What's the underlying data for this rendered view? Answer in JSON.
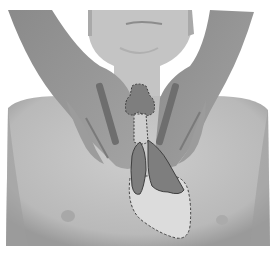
{
  "image": {
    "description": "Grayscale photo of a child's neck and upper chest with two adult hands placed on the neck; overlaid shaded shapes depict the thyroid gland, thymus lobes and a dashed outline of the heart area",
    "colors": {
      "background": "#ffffff",
      "skin_light": "#c9c9c9",
      "skin_mid": "#b3b3b3",
      "hands": "#8f8f8f",
      "overlay_fill": "#7e7e7e",
      "overlay_stroke": "#3f3f3f",
      "heart_fill": "#dcdcdc"
    },
    "overlays": [
      {
        "name": "thyroid",
        "style": "dashed outline, dark fill"
      },
      {
        "name": "trachea",
        "style": "dashed outline, light fill"
      },
      {
        "name": "thymus-left-lobe",
        "style": "solid outline, dark fill"
      },
      {
        "name": "thymus-right-lobe",
        "style": "solid outline, dark fill"
      },
      {
        "name": "heart",
        "style": "dashed outline, light fill"
      }
    ]
  }
}
